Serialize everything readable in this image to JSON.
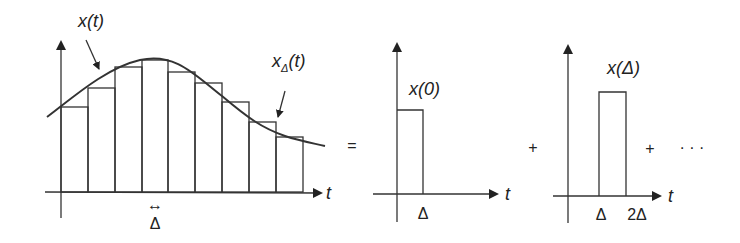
{
  "figure": {
    "main_plot": {
      "curve_label": "x(t)",
      "approx_label_base": "x",
      "approx_label_sub": "Δ",
      "approx_label_arg": "(t)",
      "axis_label": "t",
      "width_arrow": "↔",
      "width_label": "Δ",
      "bar_count": 9
    },
    "equals_sign": "=",
    "pulse_1": {
      "height_label": "x(0)",
      "axis_label": "t",
      "tick_label": "Δ"
    },
    "plus_1": "+",
    "pulse_2": {
      "height_label": "x(Δ)",
      "axis_label": "t",
      "tick_label_1": "Δ",
      "tick_label_2": "2Δ"
    },
    "plus_2": "+",
    "ellipsis": "· · ·"
  }
}
